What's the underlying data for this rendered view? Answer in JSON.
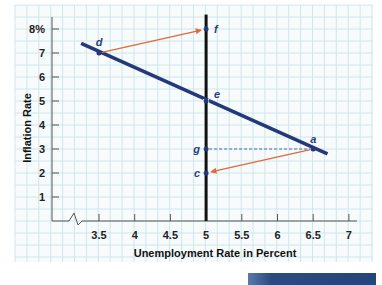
{
  "chart_data": {
    "type": "line",
    "title": "",
    "xlabel": "Unemployment Rate in Percent",
    "ylabel": "Inflation Rate",
    "x_ticks": [
      "3.5",
      "4",
      "4.5",
      "5",
      "5.5",
      "6",
      "6.5",
      "7"
    ],
    "y_ticks": [
      "1",
      "2",
      "3",
      "4",
      "5",
      "6",
      "7",
      "8%"
    ],
    "xlim": [
      3.0,
      7.0
    ],
    "ylim": [
      0,
      8
    ],
    "x_axis_break": true,
    "grid": true,
    "series": [
      {
        "name": "Short-run Phillips curve",
        "color": "#24397a",
        "x": [
          3.25,
          6.7
        ],
        "y": [
          7.4,
          2.8
        ]
      },
      {
        "name": "Long-run Phillips curve (vertical at 5%)",
        "color": "#111111",
        "x": [
          5,
          5
        ],
        "y": [
          0,
          8.6
        ]
      }
    ],
    "points": [
      {
        "label": "d",
        "x": 3.5,
        "y": 7
      },
      {
        "label": "f",
        "x": 5,
        "y": 8
      },
      {
        "label": "e",
        "x": 5,
        "y": 5
      },
      {
        "label": "g",
        "x": 5,
        "y": 3
      },
      {
        "label": "a",
        "x": 6.5,
        "y": 3
      },
      {
        "label": "c",
        "x": 5,
        "y": 2
      }
    ],
    "arrows": [
      {
        "from": "d",
        "to": "f",
        "color": "#e0683a"
      },
      {
        "from": "a",
        "to": "c",
        "color": "#e0683a"
      }
    ],
    "dashed_lines": [
      {
        "from": "g",
        "to": "a",
        "color": "#4a66a8"
      }
    ]
  },
  "colors": {
    "grid": "#cfe6ec",
    "curve": "#24397a",
    "vertical": "#111111",
    "arrow": "#e0683a"
  }
}
